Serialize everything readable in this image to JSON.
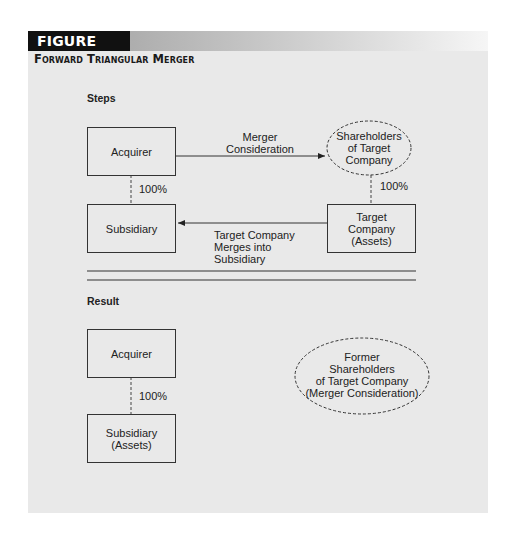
{
  "figure": {
    "number_label": "FIGURE 16.4",
    "title": "Forward Triangular Merger",
    "colors": {
      "header_label_bg": "#111111",
      "panel_bg": "#e9e9e9",
      "line": "#333333"
    }
  },
  "steps": {
    "heading": "Steps",
    "acquirer": "Acquirer",
    "subsidiary": "Subsidiary",
    "shareholders": [
      "Shareholders",
      "of Target",
      "Company"
    ],
    "target": [
      "Target",
      "Company",
      "(Assets)"
    ],
    "acquirer_subsidiary_ownership": "100%",
    "shareholders_target_ownership": "100%",
    "arrow_top_label": [
      "Merger",
      "Consideration"
    ],
    "arrow_bottom_label": [
      "Target Company",
      "Merges into",
      "Subsidiary"
    ]
  },
  "result": {
    "heading": "Result",
    "acquirer": "Acquirer",
    "subsidiary": [
      "Subsidiary",
      "(Assets)"
    ],
    "ownership": "100%",
    "former_shareholders": [
      "Former",
      "Shareholders",
      "of Target Company",
      "(Merger Consideration)"
    ]
  }
}
